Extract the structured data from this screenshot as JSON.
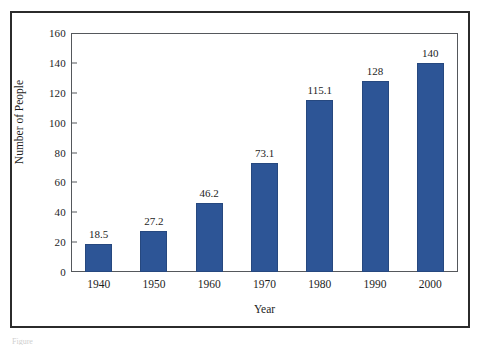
{
  "figure": {
    "caption_fragment": "Figure"
  },
  "chart_data": {
    "type": "bar",
    "title": "",
    "xlabel": "Year",
    "ylabel": "Number of People",
    "categories": [
      "1940",
      "1950",
      "1960",
      "1970",
      "1980",
      "1990",
      "2000"
    ],
    "values": [
      18.5,
      27.2,
      46.2,
      73.1,
      115.1,
      128,
      140
    ],
    "value_labels": [
      "18.5",
      "27.2",
      "46.2",
      "73.1",
      "115.1",
      "128",
      "140"
    ],
    "ylim": [
      0,
      160
    ],
    "ytick_step": 20,
    "yticks": [
      0,
      20,
      40,
      60,
      80,
      100,
      120,
      140,
      160
    ],
    "ytick_labels": [
      "0",
      "20",
      "40",
      "60",
      "80",
      "100",
      "120",
      "140",
      "160"
    ],
    "grid": false,
    "legend": null,
    "bar_color": "#2d5596",
    "axis_color": "#55585c",
    "text_color": "#1d1d1d"
  }
}
